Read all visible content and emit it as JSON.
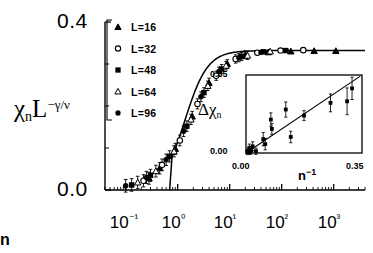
{
  "chart_data": {
    "type": "scatter",
    "title": "",
    "xlabel": "n",
    "ylabel": "χₙL^(-γ/ν)",
    "xscale": "log",
    "xlim": [
      0.04,
      4000
    ],
    "ylim": [
      0.0,
      0.4
    ],
    "ytick_labels": [
      "0.0",
      "0.4"
    ],
    "ytick_values": [
      0.0,
      0.4
    ],
    "xtick_labels": [
      "10⁻¹",
      "10⁰",
      "10¹",
      "10²",
      "10³"
    ],
    "xtick_values": [
      0.1,
      1,
      10,
      100,
      1000
    ],
    "grid": false,
    "legend_position": "upper-left",
    "legend": [
      {
        "label": "L=16",
        "marker": "filled-triangle"
      },
      {
        "label": "L=32",
        "marker": "open-circle"
      },
      {
        "label": "L=48",
        "marker": "filled-square"
      },
      {
        "label": "L=64",
        "marker": "open-triangle"
      },
      {
        "label": "L=96",
        "marker": "filled-circle"
      }
    ],
    "series": [
      {
        "name": "L=16",
        "marker": "filled-triangle",
        "points": [
          {
            "x": 0.28,
            "y": 0.028
          },
          {
            "x": 0.45,
            "y": 0.052
          },
          {
            "x": 0.9,
            "y": 0.098
          },
          {
            "x": 1.9,
            "y": 0.175
          },
          {
            "x": 4.0,
            "y": 0.255
          },
          {
            "x": 9.0,
            "y": 0.3
          },
          {
            "x": 20.0,
            "y": 0.322
          },
          {
            "x": 55.0,
            "y": 0.328
          },
          {
            "x": 150.0,
            "y": 0.33
          },
          {
            "x": 420.0,
            "y": 0.331
          },
          {
            "x": 1100.0,
            "y": 0.331
          }
        ]
      },
      {
        "name": "L=32",
        "marker": "open-circle",
        "points": [
          {
            "x": 0.22,
            "y": 0.022
          },
          {
            "x": 0.5,
            "y": 0.06
          },
          {
            "x": 1.1,
            "y": 0.118
          },
          {
            "x": 2.4,
            "y": 0.205
          },
          {
            "x": 5.5,
            "y": 0.272
          },
          {
            "x": 13.0,
            "y": 0.312
          },
          {
            "x": 34.0,
            "y": 0.327
          },
          {
            "x": 95.0,
            "y": 0.332
          },
          {
            "x": 260.0,
            "y": 0.333
          }
        ]
      },
      {
        "name": "L=48",
        "marker": "filled-square",
        "points": [
          {
            "x": 0.13,
            "y": 0.012
          },
          {
            "x": 0.3,
            "y": 0.035
          },
          {
            "x": 0.7,
            "y": 0.08
          },
          {
            "x": 1.5,
            "y": 0.152
          },
          {
            "x": 3.2,
            "y": 0.232
          },
          {
            "x": 7.0,
            "y": 0.288
          },
          {
            "x": 17.0,
            "y": 0.318
          },
          {
            "x": 45.0,
            "y": 0.329
          },
          {
            "x": 120.0,
            "y": 0.332
          }
        ]
      },
      {
        "name": "L=64",
        "marker": "open-triangle",
        "points": [
          {
            "x": 0.17,
            "y": 0.018
          },
          {
            "x": 0.38,
            "y": 0.045
          },
          {
            "x": 0.85,
            "y": 0.092
          },
          {
            "x": 1.8,
            "y": 0.168
          },
          {
            "x": 3.8,
            "y": 0.248
          },
          {
            "x": 8.5,
            "y": 0.296
          },
          {
            "x": 22.0,
            "y": 0.32
          },
          {
            "x": 60.0,
            "y": 0.33
          }
        ]
      },
      {
        "name": "L=96",
        "marker": "filled-circle",
        "points": [
          {
            "x": 0.1,
            "y": 0.01
          },
          {
            "x": 0.25,
            "y": 0.03
          },
          {
            "x": 0.6,
            "y": 0.072
          },
          {
            "x": 1.3,
            "y": 0.14
          },
          {
            "x": 2.8,
            "y": 0.222
          },
          {
            "x": 6.2,
            "y": 0.282
          },
          {
            "x": 15.0,
            "y": 0.315
          },
          {
            "x": 40.0,
            "y": 0.328
          }
        ]
      }
    ],
    "fit_curve": {
      "name": "theory-curve",
      "description": "solid curve rising from zero near n=1 to plateau 0.332",
      "plateau": 0.332
    }
  },
  "inset": {
    "type": "scatter",
    "xlabel": "n⁻¹",
    "ylabel": "Δχₙ",
    "xlim": [
      0.0,
      0.35
    ],
    "ylim": [
      0.0,
      0.35
    ],
    "xtick_labels": [
      "0.00",
      "0.35"
    ],
    "ytick_labels": [
      "0.00",
      "0.35"
    ],
    "grid": false,
    "fit_line": {
      "name": "linear-fit",
      "slope": 1.0,
      "intercept": 0.0
    },
    "points": [
      {
        "x": 0.004,
        "y": 0.005,
        "err": 0.012
      },
      {
        "x": 0.008,
        "y": 0.01,
        "err": 0.014
      },
      {
        "x": 0.01,
        "y": 0.022,
        "err": 0.018
      },
      {
        "x": 0.012,
        "y": 0.006,
        "err": 0.012
      },
      {
        "x": 0.016,
        "y": 0.012,
        "err": 0.016
      },
      {
        "x": 0.02,
        "y": 0.03,
        "err": 0.02
      },
      {
        "x": 0.03,
        "y": 0.008,
        "err": 0.014
      },
      {
        "x": 0.052,
        "y": 0.062,
        "err": 0.03
      },
      {
        "x": 0.058,
        "y": 0.04,
        "err": 0.026
      },
      {
        "x": 0.075,
        "y": 0.15,
        "err": 0.03
      },
      {
        "x": 0.078,
        "y": 0.108,
        "err": 0.024
      },
      {
        "x": 0.12,
        "y": 0.195,
        "err": 0.034
      },
      {
        "x": 0.135,
        "y": 0.072,
        "err": 0.026
      },
      {
        "x": 0.175,
        "y": 0.168,
        "err": 0.022
      },
      {
        "x": 0.255,
        "y": 0.225,
        "err": 0.04
      },
      {
        "x": 0.305,
        "y": 0.232,
        "err": 0.06
      },
      {
        "x": 0.32,
        "y": 0.29,
        "err": 0.05
      }
    ]
  }
}
